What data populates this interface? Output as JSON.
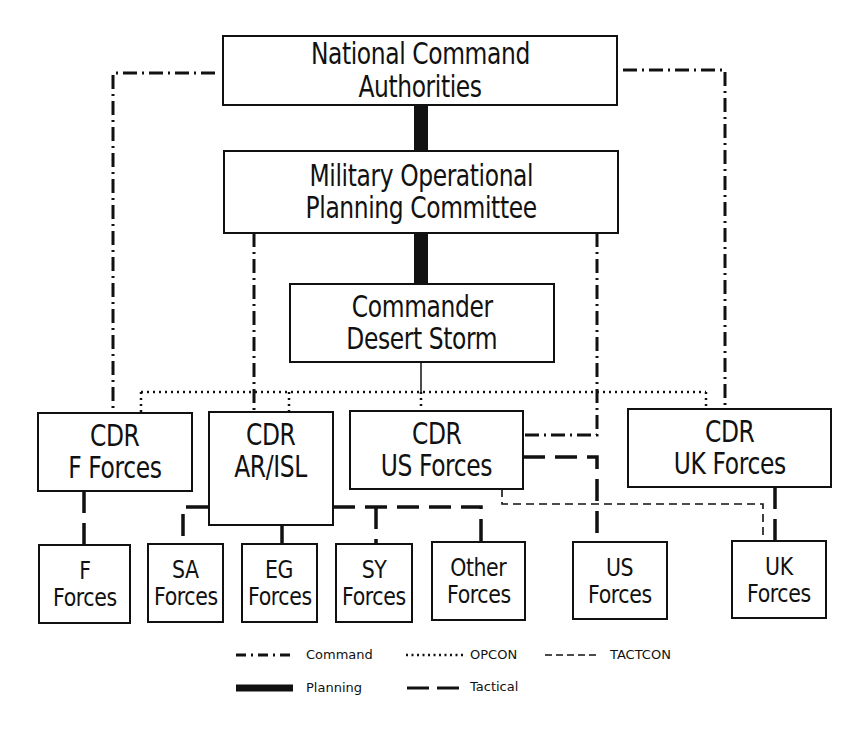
{
  "diagram": {
    "type": "organization-chart",
    "nodes": {
      "nca": {
        "line1": "National Command",
        "line2": "Authorities"
      },
      "mopc": {
        "line1": "Military Operational",
        "line2": "Planning Committee"
      },
      "cds": {
        "line1": "Commander",
        "line2": "Desert Storm"
      },
      "cdr_f": {
        "line1": "CDR",
        "line2": "F Forces"
      },
      "cdr_ar": {
        "line1": "CDR",
        "line2": "AR/ISL"
      },
      "cdr_us": {
        "line1": "CDR",
        "line2": "US Forces"
      },
      "cdr_uk": {
        "line1": "CDR",
        "line2": "UK Forces"
      },
      "f_forces": {
        "line1": "F",
        "line2": "Forces"
      },
      "sa_forces": {
        "line1": "SA",
        "line2": "Forces"
      },
      "eg_forces": {
        "line1": "EG",
        "line2": "Forces"
      },
      "sy_forces": {
        "line1": "SY",
        "line2": "Forces"
      },
      "other_forces": {
        "line1": "Other",
        "line2": "Forces"
      },
      "us_forces": {
        "line1": "US",
        "line2": "Forces"
      },
      "uk_forces": {
        "line1": "UK",
        "line2": "Forces"
      }
    },
    "edges": [
      {
        "from": "nca",
        "to": "mopc",
        "type": "Planning"
      },
      {
        "from": "mopc",
        "to": "cds",
        "type": "Planning"
      },
      {
        "from": "nca",
        "to": "cdr_f",
        "type": "Command"
      },
      {
        "from": "nca",
        "to": "cdr_uk",
        "type": "Command"
      },
      {
        "from": "mopc",
        "to": "cdr_ar",
        "type": "Command"
      },
      {
        "from": "mopc",
        "to": "cdr_us",
        "type": "Command"
      },
      {
        "from": "cds",
        "to": "cdr_f",
        "type": "OPCON"
      },
      {
        "from": "cds",
        "to": "cdr_ar",
        "type": "OPCON"
      },
      {
        "from": "cds",
        "to": "cdr_us",
        "type": "OPCON"
      },
      {
        "from": "cds",
        "to": "cdr_uk",
        "type": "OPCON"
      },
      {
        "from": "cdr_f",
        "to": "f_forces",
        "type": "Tactical"
      },
      {
        "from": "cdr_ar",
        "to": "sa_forces",
        "type": "Tactical"
      },
      {
        "from": "cdr_ar",
        "to": "eg_forces",
        "type": "Tactical"
      },
      {
        "from": "cdr_ar",
        "to": "sy_forces",
        "type": "Tactical"
      },
      {
        "from": "cdr_ar",
        "to": "other_forces",
        "type": "Tactical"
      },
      {
        "from": "cdr_us",
        "to": "us_forces",
        "type": "Tactical"
      },
      {
        "from": "cdr_uk",
        "to": "uk_forces",
        "type": "Tactical"
      },
      {
        "from": "cdr_us",
        "to": "uk_forces",
        "type": "TACTCON"
      }
    ]
  },
  "legend": {
    "command": "Command",
    "opcon": "OPCON",
    "tactcon": "TACTCON",
    "planning": "Planning",
    "tactical": "Tactical"
  },
  "colors": {
    "ink": "#111111",
    "background": "#ffffff"
  }
}
